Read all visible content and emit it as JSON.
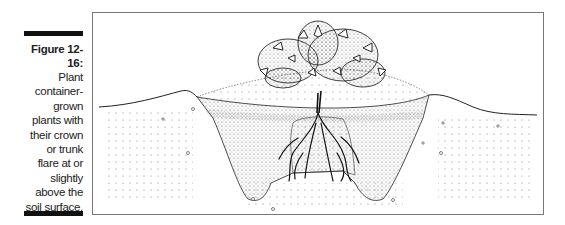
{
  "caption": {
    "label": "Figure 12-16:",
    "lines": [
      "Plant",
      "container-",
      "grown",
      "plants with",
      "their crown",
      "or trunk",
      "flare at or",
      "slightly",
      "above the",
      "soil surface."
    ]
  },
  "figure": {
    "colors": {
      "ink": "#222222",
      "border": "#777777"
    }
  }
}
